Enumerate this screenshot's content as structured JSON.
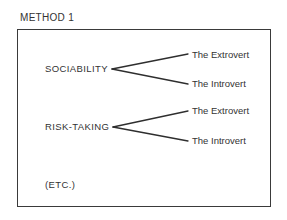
{
  "title": "METHOD 1",
  "traits": [
    {
      "label": "SOCIABILITY",
      "branches": [
        "The Extrovert",
        "The Introvert"
      ]
    },
    {
      "label": "RISK-TAKING",
      "branches": [
        "The Extrovert",
        "The Introvert"
      ]
    }
  ],
  "continuation": "(ETC.)",
  "colors": {
    "ink": "#333333",
    "frame": "#3a3a3a",
    "background": "#ffffff"
  }
}
